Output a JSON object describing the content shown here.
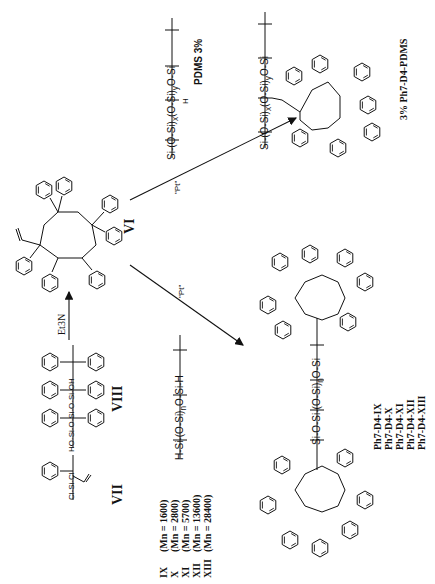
{
  "scheme": {
    "orientation": "rotated 90 degrees counter-clockwise",
    "compounds": {
      "VII": {
        "label": "VII",
        "formula_text": "Cl-Si-Cl",
        "substituents": [
          "phenyl",
          "vinyl"
        ]
      },
      "VIII": {
        "label": "VIII",
        "formula_text": "HO-Si-O-Si-O-Si-OH",
        "substituents": [
          "6 x phenyl"
        ]
      },
      "VI": {
        "label": "VI",
        "ring_atoms": [
          "Si",
          "O",
          "Si",
          "O",
          "Si",
          "O",
          "Si",
          "O"
        ],
        "substituents": [
          "vinyl",
          "7 x phenyl"
        ]
      },
      "PDMS_H": {
        "label": "PDMS 3%",
        "chain_text": [
          "Si",
          "O-Si",
          "O-Si",
          "O-Si"
        ],
        "subscripts": [
          "x",
          "y"
        ],
        "side_atom": "H"
      },
      "H_PDMS": {
        "chain_text": [
          "H-Si",
          "O-Si",
          "O-Si-H"
        ],
        "subscript": "n"
      },
      "product_top": {
        "label": "3% Ph7-D4-PDMS",
        "subscripts": [
          "x",
          "y"
        ]
      },
      "product_bottom": {
        "subscript": "n"
      }
    },
    "reagents": {
      "step1": "Et3N",
      "step2a": "\"Pt\"",
      "step2b": "\"Pt\""
    },
    "atom_labels": {
      "si": "Si",
      "o": "O",
      "h": "H",
      "oh": "OH",
      "ho": "HO",
      "cl": "Cl"
    },
    "molecular_weights": [
      {
        "code": "IX",
        "mn": "(Mn = 1600)"
      },
      {
        "code": "X",
        "mn": "(Mn = 2800)"
      },
      {
        "code": "XI",
        "mn": "(Mn = 5700)"
      },
      {
        "code": "XII",
        "mn": "(Mn = 13600)"
      },
      {
        "code": "XIII",
        "mn": "(Mn = 28400)"
      }
    ],
    "products": [
      "Ph7-D4-IX",
      "Ph7-D4-X",
      "Ph7-D4-XI",
      "Ph7-D4-XII",
      "Ph7-D4-XIII"
    ],
    "top_product_label": "3% Ph7-D4-PDMS",
    "pdms_label": "PDMS 3%"
  }
}
